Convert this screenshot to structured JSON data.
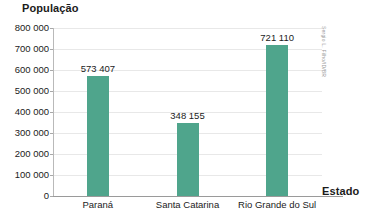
{
  "chart_data": {
    "type": "bar",
    "title": "",
    "ylabel": "População",
    "xlabel": "Estado",
    "categories": [
      "Paraná",
      "Santa Catarina",
      "Rio Grande do Sul"
    ],
    "values": [
      573407,
      348155,
      721110
    ],
    "value_labels": [
      "573 407",
      "348 155",
      "721 110"
    ],
    "ylim": [
      0,
      800000
    ],
    "ytick_values": [
      0,
      100000,
      200000,
      300000,
      400000,
      500000,
      600000,
      700000,
      800000
    ],
    "ytick_labels": [
      "0",
      "100 000",
      "200 000",
      "300 000",
      "400 000",
      "500 000",
      "600 000",
      "700 000",
      "800 000"
    ],
    "grid": true,
    "legend": "none",
    "bar_color": "#4fa58c",
    "gridline_color": "#e8e8e8",
    "axis_color": "#9a9a9a",
    "text_color": "#1b1b1b"
  },
  "credit": {
    "text": "Sergio L. Filho/ID/BR"
  }
}
